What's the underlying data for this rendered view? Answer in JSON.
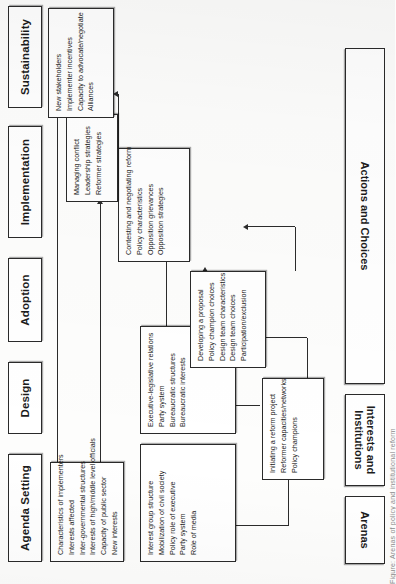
{
  "figure": {
    "caption": "Figure: Arenas of policy and institutional reform",
    "orientation": "page rotated 90 degrees counter-clockwise"
  },
  "column_headers": [
    {
      "label": "Agenda Setting"
    },
    {
      "label": "Design"
    },
    {
      "label": "Adoption"
    },
    {
      "label": "Implementation"
    },
    {
      "label": "Sustainability"
    }
  ],
  "row_labels": [
    {
      "label": "Arenas"
    },
    {
      "label": "Interests and\nInstitutions"
    },
    {
      "label": "Actions and Choices"
    }
  ],
  "boxes": [
    {
      "id": "agenda-institutions",
      "column": "Agenda Setting",
      "row": "Interests and Institutions",
      "items": [
        "Interest group structure",
        "Mobilization of civil society",
        "Policy role of executive",
        "Party system",
        "Role of media"
      ]
    },
    {
      "id": "adoption-institutions",
      "column": "Adoption",
      "row": "Interests and Institutions",
      "items": [
        "Executive-legislative relations",
        "Party system",
        "Bureaucratic structures",
        "Bureaucratic interests"
      ]
    },
    {
      "id": "implementation-institutions",
      "column": "Implementation",
      "row": "Interests and Institutions",
      "items": [
        "Characteristics of implementers",
        "Interests affected",
        "Inter-governmental structures",
        "Interests of high/middle level officials",
        "Capacity of public sector",
        "New interests"
      ]
    },
    {
      "id": "agenda-actions",
      "column": "Agenda Setting / Design",
      "row": "Actions and Choices",
      "items": [
        "Initiating a reform project",
        "Reformer capacities/networks",
        "Policy champions"
      ]
    },
    {
      "id": "design-actions",
      "column": "Design",
      "row": "Actions and Choices",
      "items": [
        "Developing a proposal",
        "Policy champion choices",
        "Design team characteristics",
        "Design team choices",
        "Participation/exclusion"
      ]
    },
    {
      "id": "adoption-actions",
      "column": "Adoption",
      "row": "Actions and Choices",
      "items": [
        "Contesting and negotiating reform",
        "Policy characteristics",
        "Opposition grievances",
        "Opposition strategies"
      ]
    },
    {
      "id": "implementation-actions",
      "column": "Implementation",
      "row": "Actions and Choices",
      "items": [
        "Managing conflict",
        "Leadership strategies",
        "Reformer strategies"
      ]
    },
    {
      "id": "sustainability-actions",
      "column": "Sustainability",
      "row": "Actions and Choices",
      "items": [
        "New stakeholders",
        "Implementer incentives",
        "Capacity to advocate/negotiate",
        "Alliances"
      ]
    }
  ]
}
